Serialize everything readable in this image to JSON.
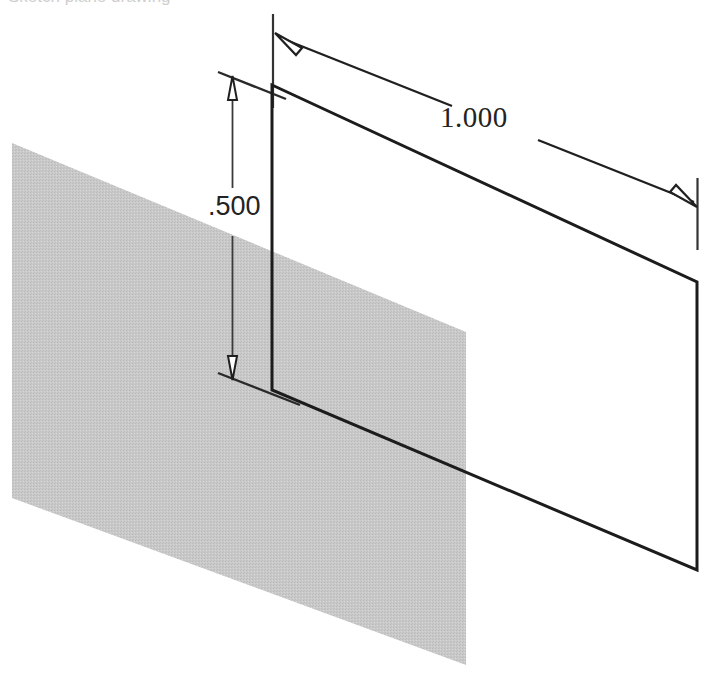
{
  "document": {
    "title": "Isometric sketch with linear dimensions",
    "background_color": "#ffffff",
    "width": 720,
    "height": 682,
    "clipped_header_text": "Sketch plane drawing"
  },
  "dimensions": {
    "horizontal": {
      "label": "1.000",
      "name": "length-dimension",
      "units": "inches",
      "value": 1.0,
      "arrowheads": "both-ends",
      "line_color": "#202020",
      "text_color": "#232323"
    },
    "vertical": {
      "label": ".500",
      "name": "height-dimension",
      "units": "inches",
      "value": 0.5,
      "arrowheads": "both-ends",
      "line_color": "#202020",
      "text_color": "#232323"
    }
  },
  "geometry": {
    "face": {
      "name": "sketch-face-outline",
      "stroke_color": "#1c1c1c",
      "stroke_width": 3,
      "fill": "none",
      "points": "272,85 697,282 697,570 272,390"
    },
    "reference_plane": {
      "name": "reference-plane-fill",
      "fill_color": "#c8c8c8",
      "opacity": 0.85,
      "points": "12,143 466,332 466,665 12,498"
    }
  },
  "extension_lines": {
    "color": "#3a3a3a",
    "width": 1.4
  }
}
